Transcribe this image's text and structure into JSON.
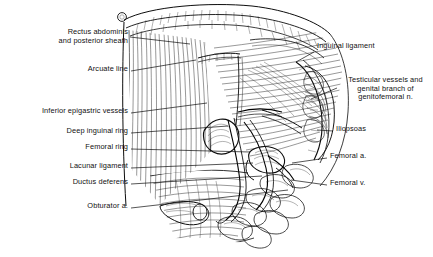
{
  "figure": {
    "type": "anatomical-line-illustration",
    "background_color": "#ffffff",
    "ink_color": "#0d0d0d",
    "width": 433,
    "height": 257
  },
  "labels": {
    "left": [
      {
        "id": "rectus-abdominis",
        "text": "Rectus abdominis\nand posterior sheath",
        "line1": "Rectus abdominis",
        "line2": "and posterior sheath",
        "x": 128,
        "y": 33,
        "align": "right",
        "leader": "M130,37 L190,44"
      },
      {
        "id": "arcuate-line",
        "text": "Arcuate line",
        "x": 128,
        "y": 69,
        "align": "right",
        "leader": "M131,71 L196,60"
      },
      {
        "id": "inferior-epigastric-vessels",
        "text": "Inferior epigastric vessels",
        "x": 128,
        "y": 111,
        "align": "right",
        "leader": "M131,113 L205,103"
      },
      {
        "id": "deep-inguinal-ring",
        "text": "Deep inguinal ring",
        "x": 128,
        "y": 131,
        "align": "right",
        "leader": "M131,133 L228,126"
      },
      {
        "id": "femoral-ring",
        "text": "Femoral ring",
        "x": 128,
        "y": 147,
        "align": "right",
        "leader": "M131,149 L248,152"
      },
      {
        "id": "lacunar-ligament",
        "text": "Lacunar ligament",
        "x": 128,
        "y": 166,
        "align": "right",
        "leader": "M131,168 L253,163"
      },
      {
        "id": "ductus-deferens",
        "text": "Ductus deferens",
        "x": 128,
        "y": 182,
        "align": "right",
        "leader": "M131,184 L262,176"
      },
      {
        "id": "obturator-a",
        "text": "Obturator a.",
        "x": 128,
        "y": 206,
        "align": "right",
        "leader": "M131,208 L286,190"
      }
    ],
    "right": [
      {
        "id": "inguinal-ligament",
        "text": "Inguinal ligament",
        "x": 317,
        "y": 46,
        "align": "left",
        "leader": "M314,52 L296,62"
      },
      {
        "id": "testicular-vessels",
        "text": "Testicular vessels and\ngenital branch of\ngenitofemoral n.",
        "line1": "Testicular vessels and",
        "line2": "genital branch of",
        "line3": "genitofemoral n.",
        "x": 340,
        "y": 80,
        "align": "center",
        "leader": "M337,88 L311,99"
      },
      {
        "id": "iliopsoas",
        "text": "Iliopsoas",
        "x": 336,
        "y": 128,
        "align": "left",
        "leader": "M333,131 L317,130"
      },
      {
        "id": "femoral-a",
        "text": "Femoral a.",
        "x": 330,
        "y": 155,
        "align": "left",
        "leader": "M327,158 L292,163"
      },
      {
        "id": "femoral-v",
        "text": "Femoral v.",
        "x": 330,
        "y": 182,
        "align": "left",
        "leader": "M327,185 L291,180"
      }
    ]
  },
  "structures": [
    {
      "id": "rectus-sheath-arch",
      "name": "cut arching edge of rectus sheath"
    },
    {
      "id": "rectus-muscle",
      "name": "rectus abdominis muscle belly"
    },
    {
      "id": "arcuate-line-edge",
      "name": "arcuate line"
    },
    {
      "id": "transversalis-fascia",
      "name": "transversalis fascia hatching"
    },
    {
      "id": "deep-ring-opening",
      "name": "deep inguinal ring aperture"
    },
    {
      "id": "femoral-ring-opening",
      "name": "femoral ring aperture"
    },
    {
      "id": "ductus-tube",
      "name": "ductus deferens tube"
    },
    {
      "id": "obturator-vessel-stump",
      "name": "obturator artery stump"
    },
    {
      "id": "iliopsoas-muscle",
      "name": "iliopsoas muscle mass"
    },
    {
      "id": "inguinal-ligament-band",
      "name": "inguinal ligament band"
    },
    {
      "id": "lymph-node-cluster",
      "name": "lobulated lymph node / fat cluster"
    },
    {
      "id": "cut-edge-marker",
      "name": "small circular cut-edge marker"
    }
  ]
}
